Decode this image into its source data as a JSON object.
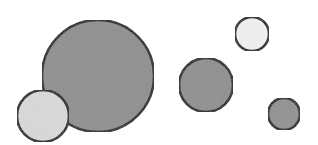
{
  "canvas": {
    "width": 318,
    "height": 145,
    "background": "#ffffff"
  },
  "colors": {
    "stroke": "#1a1a1a",
    "dark_fill": "#8c8c8c",
    "light_fill": "#dcdcdc",
    "white_fill": "#f4f4f4"
  },
  "circles": [
    {
      "name": "large-gray-circle",
      "cx": 98,
      "cy": 76,
      "r": 56,
      "fill": "#8e8e8e"
    },
    {
      "name": "light-circle-left",
      "cx": 43,
      "cy": 116,
      "r": 26,
      "fill": "#dadada"
    },
    {
      "name": "medium-gray-circle",
      "cx": 206,
      "cy": 85,
      "r": 27,
      "fill": "#8e8e8e"
    },
    {
      "name": "small-white-circle",
      "cx": 252,
      "cy": 34,
      "r": 17,
      "fill": "#f2f2f2"
    },
    {
      "name": "small-gray-circle",
      "cx": 284,
      "cy": 114,
      "r": 16,
      "fill": "#909090"
    }
  ]
}
